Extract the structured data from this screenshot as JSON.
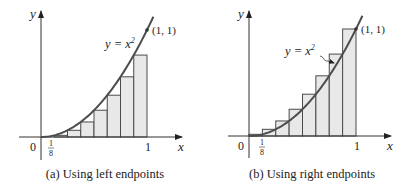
{
  "colors": {
    "rect_fill": "#e8e8e8",
    "rect_stroke": "#4a4a4a",
    "curve": "#4d4d4d",
    "axis": "#333333",
    "text": "#222222"
  },
  "panels": [
    {
      "id": "a",
      "caption": "(a) Using left endpoints",
      "y_axis_label": "y",
      "x_axis_label": "x",
      "origin_label": "0",
      "tick_eighth_num": "1",
      "tick_eighth_den": "8",
      "tick_one": "1",
      "curve_label": "y = x",
      "curve_label_exp": "2",
      "point_label": "(1, 1)"
    },
    {
      "id": "b",
      "caption": "(b) Using right endpoints",
      "y_axis_label": "y",
      "x_axis_label": "x",
      "origin_label": "0",
      "tick_eighth_num": "1",
      "tick_eighth_den": "8",
      "tick_one": "1",
      "curve_label": "y = x",
      "curve_label_exp": "2",
      "point_label": "(1, 1)"
    }
  ],
  "chart_data": [
    {
      "type": "area",
      "title": "(a) Using left endpoints",
      "function": "y = x^2",
      "xlabel": "x",
      "ylabel": "y",
      "xlim": [
        0,
        1
      ],
      "ylim": [
        0,
        1
      ],
      "n_rectangles": 8,
      "endpoint_rule": "left",
      "x_ticks": [
        "0",
        "1/8",
        "1"
      ],
      "rectangles": [
        {
          "x0": 0.0,
          "x1": 0.125,
          "height": 0.0
        },
        {
          "x0": 0.125,
          "x1": 0.25,
          "height": 0.015625
        },
        {
          "x0": 0.25,
          "x1": 0.375,
          "height": 0.0625
        },
        {
          "x0": 0.375,
          "x1": 0.5,
          "height": 0.140625
        },
        {
          "x0": 0.5,
          "x1": 0.625,
          "height": 0.25
        },
        {
          "x0": 0.625,
          "x1": 0.75,
          "height": 0.390625
        },
        {
          "x0": 0.75,
          "x1": 0.875,
          "height": 0.5625
        },
        {
          "x0": 0.875,
          "x1": 1.0,
          "height": 0.765625
        }
      ],
      "annotations": [
        "y = x^2",
        "(1, 1)"
      ]
    },
    {
      "type": "area",
      "title": "(b) Using right endpoints",
      "function": "y = x^2",
      "xlabel": "x",
      "ylabel": "y",
      "xlim": [
        0,
        1
      ],
      "ylim": [
        0,
        1
      ],
      "n_rectangles": 8,
      "endpoint_rule": "right",
      "x_ticks": [
        "0",
        "1/8",
        "1"
      ],
      "rectangles": [
        {
          "x0": 0.0,
          "x1": 0.125,
          "height": 0.015625
        },
        {
          "x0": 0.125,
          "x1": 0.25,
          "height": 0.0625
        },
        {
          "x0": 0.25,
          "x1": 0.375,
          "height": 0.140625
        },
        {
          "x0": 0.375,
          "x1": 0.5,
          "height": 0.25
        },
        {
          "x0": 0.5,
          "x1": 0.625,
          "height": 0.390625
        },
        {
          "x0": 0.625,
          "x1": 0.75,
          "height": 0.5625
        },
        {
          "x0": 0.75,
          "x1": 0.875,
          "height": 0.765625
        },
        {
          "x0": 0.875,
          "x1": 1.0,
          "height": 1.0
        }
      ],
      "annotations": [
        "y = x^2",
        "(1, 1)"
      ]
    }
  ]
}
